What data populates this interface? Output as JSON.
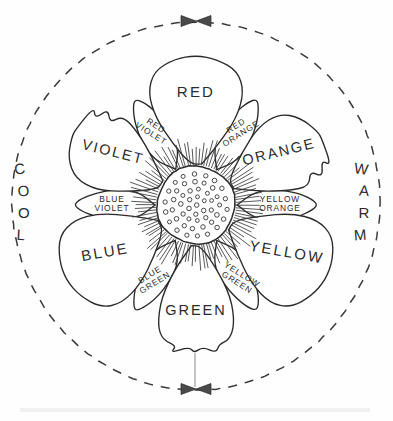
{
  "diagram": {
    "center": {
      "cx": 196,
      "cy": 205
    },
    "outer_circle": {
      "radius": 184,
      "style": "dashed"
    },
    "core": {
      "radius": 39,
      "label": "dotted-center-disk"
    },
    "temperature_labels": [
      {
        "name": "cool-label",
        "text": "COOL",
        "side": "left",
        "angle_deg": 180
      },
      {
        "name": "warm-label",
        "text": "WARM",
        "side": "right",
        "angle_deg": 0
      }
    ],
    "markers": [
      {
        "name": "top-bowtie-marker",
        "position": "top",
        "shape": "double-triangle"
      },
      {
        "name": "bottom-bowtie-marker",
        "position": "bottom",
        "shape": "double-triangle"
      }
    ],
    "petals": [
      {
        "id": "red",
        "label": "RED",
        "tier": "primary",
        "angle_deg": 90,
        "length": 150,
        "width": 56,
        "shape": "broad-round",
        "label_r": 108,
        "label_rot": 0,
        "font": "lbl-primary"
      },
      {
        "id": "red-orange",
        "label": "RED ORANGE",
        "tier": "tertiary",
        "angle_deg": 60,
        "length": 122,
        "width": 26,
        "shape": "slim-point",
        "label_r": 86,
        "label_rot": -32,
        "font": "lbl-tertiary"
      },
      {
        "id": "orange",
        "label": "ORANGE",
        "tier": "secondary",
        "angle_deg": 30,
        "length": 142,
        "width": 46,
        "shape": "notched",
        "label_r": 97,
        "label_rot": -14,
        "font": "lbl-secondary"
      },
      {
        "id": "yellow-orange",
        "label": "YELLOW ORANGE",
        "tier": "tertiary",
        "angle_deg": 0,
        "length": 122,
        "width": 26,
        "shape": "slim-point",
        "label_r": 84,
        "label_rot": 0,
        "font": "lbl-tertiary"
      },
      {
        "id": "yellow",
        "label": "YELLOW",
        "tier": "primary",
        "angle_deg": -30,
        "length": 150,
        "width": 56,
        "shape": "broad-round",
        "label_r": 104,
        "label_rot": 10,
        "font": "lbl-primary"
      },
      {
        "id": "yellow-green",
        "label": "YELLOW GREEN",
        "tier": "tertiary",
        "angle_deg": -60,
        "length": 122,
        "width": 26,
        "shape": "slim-point",
        "label_r": 86,
        "label_rot": 32,
        "font": "lbl-tertiary"
      },
      {
        "id": "green",
        "label": "GREEN",
        "tier": "secondary",
        "angle_deg": -90,
        "length": 148,
        "width": 46,
        "shape": "scalloped",
        "label_r": 110,
        "label_rot": 0,
        "font": "lbl-secondary"
      },
      {
        "id": "blue-green",
        "label": "BLUE GREEN",
        "tier": "tertiary",
        "angle_deg": -120,
        "length": 122,
        "width": 26,
        "shape": "slim-point",
        "label_r": 86,
        "label_rot": -32,
        "font": "lbl-tertiary"
      },
      {
        "id": "blue",
        "label": "BLUE",
        "tier": "primary",
        "angle_deg": -150,
        "length": 150,
        "width": 56,
        "shape": "broad-round",
        "label_r": 104,
        "label_rot": -10,
        "font": "lbl-primary"
      },
      {
        "id": "blue-violet",
        "label": "BLUE VIOLET",
        "tier": "tertiary",
        "angle_deg": 180,
        "length": 122,
        "width": 26,
        "shape": "slim-point",
        "label_r": 84,
        "label_rot": 0,
        "font": "lbl-tertiary"
      },
      {
        "id": "violet",
        "label": "VIOLET",
        "tier": "secondary",
        "angle_deg": 150,
        "length": 142,
        "width": 46,
        "shape": "notched",
        "label_r": 97,
        "label_rot": 14,
        "font": "lbl-secondary"
      },
      {
        "id": "red-violet",
        "label": "RED VIOLET",
        "tier": "tertiary",
        "angle_deg": 120,
        "length": 122,
        "width": 26,
        "shape": "slim-point",
        "label_r": 86,
        "label_rot": 32,
        "font": "lbl-tertiary"
      }
    ],
    "colors": {
      "ink": "#2a2a2a",
      "paper": "#fefefe",
      "marker_fill": "#4a4a4a",
      "dash_stroke": "#3a3a3a"
    }
  }
}
